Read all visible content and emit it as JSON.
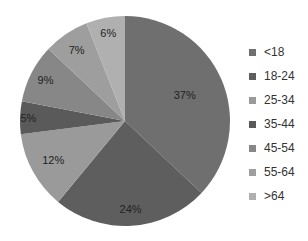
{
  "chart_data": {
    "type": "pie",
    "title": "",
    "categories": [
      "<18",
      "18-24",
      "25-34",
      "35-44",
      "45-54",
      "55-64",
      ">64"
    ],
    "values": [
      37,
      24,
      12,
      5,
      9,
      7,
      6
    ],
    "labels": [
      "37%",
      "24%",
      "12%",
      "5%",
      "9%",
      "7%",
      "6%"
    ],
    "colors": [
      "#6f6f6f",
      "#5e5e5e",
      "#9a9a9a",
      "#5a5a5a",
      "#878787",
      "#9e9e9e",
      "#b0b0b0"
    ],
    "start_angle": "12 o'clock",
    "direction": "clockwise",
    "legend_position": "right"
  },
  "legend": {
    "items": [
      {
        "label": "<18",
        "color": "#6f6f6f"
      },
      {
        "label": "18-24",
        "color": "#5e5e5e"
      },
      {
        "label": "25-34",
        "color": "#9a9a9a"
      },
      {
        "label": "35-44",
        "color": "#5a5a5a"
      },
      {
        "label": "45-54",
        "color": "#878787"
      },
      {
        "label": "55-64",
        "color": "#9e9e9e"
      },
      {
        "label": ">64",
        "color": "#b0b0b0"
      }
    ]
  }
}
